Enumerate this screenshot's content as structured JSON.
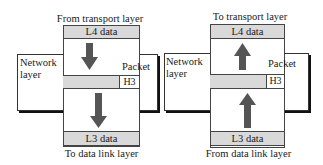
{
  "left_diagram": {
    "top_caption": "From transport layer",
    "top_box": "L4 data",
    "network_label_line1": "Network",
    "network_label_line2": "layer",
    "packet_label": "Packet",
    "header_label": "H3",
    "bottom_box": "L3 data",
    "bottom_caption": "To data link layer",
    "arrow_direction": "down"
  },
  "right_diagram": {
    "top_caption": "To transport layer",
    "top_box": "L4 data",
    "network_label_line1": "Network",
    "network_label_line2": "layer",
    "packet_label": "Packet",
    "header_label": "H3",
    "bottom_box": "L3 data",
    "bottom_caption": "From data link layer",
    "arrow_direction": "up"
  },
  "colors": {
    "box_fill": "#d9d9d9",
    "arrow": "#555555",
    "border": "#333333"
  }
}
